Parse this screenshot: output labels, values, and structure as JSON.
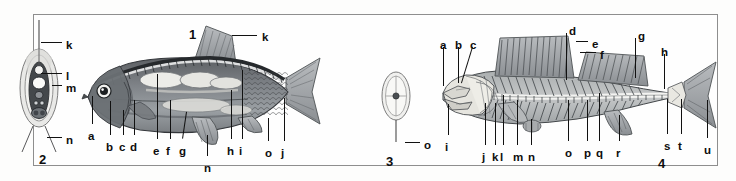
{
  "plate": {
    "title": "Fish anatomy plate",
    "background_color": "#fdfdfc",
    "frame_color": "#8e8e8e",
    "label_color": "#0d0d0d",
    "figure_numbers": [
      {
        "id": "fig1",
        "text": "1",
        "x": 189,
        "y": 28
      },
      {
        "id": "fig2",
        "text": "2",
        "x": 39,
        "y": 153
      },
      {
        "id": "fig3",
        "text": "3",
        "x": 386,
        "y": 155
      },
      {
        "id": "fig4",
        "text": "4",
        "x": 658,
        "y": 157
      }
    ]
  },
  "figure1": {
    "name": "whole-fish-lateral-view",
    "labels": [
      {
        "key": "a",
        "x": 88,
        "y": 131,
        "lead": {
          "x1": 92,
          "y1": 96,
          "x2": 92,
          "y2": 124
        }
      },
      {
        "key": "b",
        "x": 106,
        "y": 142,
        "lead": {
          "x1": 110,
          "y1": 101,
          "x2": 110,
          "y2": 135
        }
      },
      {
        "key": "c",
        "x": 119,
        "y": 142,
        "lead": {
          "x1": 123,
          "y1": 110,
          "x2": 123,
          "y2": 135
        }
      },
      {
        "key": "d",
        "x": 130,
        "y": 142,
        "lead": {
          "x1": 134,
          "y1": 100,
          "x2": 134,
          "y2": 135
        }
      },
      {
        "key": "e",
        "x": 153,
        "y": 146,
        "lead": {
          "x1": 157,
          "y1": 74,
          "x2": 157,
          "y2": 139
        }
      },
      {
        "key": "f",
        "x": 166,
        "y": 146,
        "lead": {
          "x1": 170,
          "y1": 100,
          "x2": 170,
          "y2": 139
        }
      },
      {
        "key": "g",
        "x": 179,
        "y": 146,
        "lead": {
          "x1": 187,
          "y1": 112,
          "x2": 183,
          "y2": 139
        }
      },
      {
        "key": "n",
        "x": 204,
        "y": 163,
        "lead": {
          "x1": 207,
          "y1": 135,
          "x2": 207,
          "y2": 156
        }
      },
      {
        "key": "h",
        "x": 227,
        "y": 146,
        "lead": {
          "x1": 231,
          "y1": 90,
          "x2": 231,
          "y2": 139
        }
      },
      {
        "key": "i",
        "x": 239,
        "y": 146,
        "lead": {
          "x1": 242,
          "y1": 70,
          "x2": 242,
          "y2": 139
        }
      },
      {
        "key": "o",
        "x": 265,
        "y": 148,
        "lead": {
          "x1": 268,
          "y1": 118,
          "x2": 268,
          "y2": 141
        }
      },
      {
        "key": "j",
        "x": 281,
        "y": 148,
        "lead": {
          "x1": 284,
          "y1": 98,
          "x2": 284,
          "y2": 141
        }
      },
      {
        "key": "k",
        "x": 262,
        "y": 32,
        "lead": {
          "x1": 232,
          "y1": 35,
          "x2": 257,
          "y2": 35
        }
      }
    ]
  },
  "figure2": {
    "name": "fish-cross-section-diagram",
    "labels": [
      {
        "key": "k",
        "x": 66,
        "y": 40,
        "lead": {
          "x1": 41,
          "y1": 42,
          "x2": 62,
          "y2": 42
        }
      },
      {
        "key": "l",
        "x": 66,
        "y": 71,
        "lead": {
          "x1": 41,
          "y1": 73,
          "x2": 62,
          "y2": 73
        }
      },
      {
        "key": "m",
        "x": 66,
        "y": 83,
        "lead": {
          "x1": 52,
          "y1": 85,
          "x2": 62,
          "y2": 85
        }
      },
      {
        "key": "n",
        "x": 66,
        "y": 135,
        "lead": {
          "x1": 47,
          "y1": 137,
          "x2": 62,
          "y2": 137
        }
      }
    ]
  },
  "figure3": {
    "name": "scale-or-vertebra-cross-section",
    "labels": [
      {
        "key": "o",
        "x": 424,
        "y": 140,
        "lead": {
          "x1": 405,
          "y1": 142,
          "x2": 420,
          "y2": 142
        }
      }
    ]
  },
  "figure4": {
    "name": "fish-skeleton-lateral-view",
    "labels": [
      {
        "key": "a",
        "x": 440,
        "y": 40,
        "lead": {
          "x1": 443,
          "y1": 47,
          "x2": 443,
          "y2": 86
        }
      },
      {
        "key": "b",
        "x": 455,
        "y": 40,
        "lead": {
          "x1": 458,
          "y1": 47,
          "x2": 458,
          "y2": 83
        }
      },
      {
        "key": "c",
        "x": 470,
        "y": 40,
        "lead": {
          "x1": 473,
          "y1": 47,
          "x2": 462,
          "y2": 83
        }
      },
      {
        "key": "d",
        "x": 569,
        "y": 26,
        "lead": {
          "x1": 566,
          "y1": 33,
          "x2": 566,
          "y2": 80
        }
      },
      {
        "key": "e",
        "x": 592,
        "y": 39,
        "lead": {
          "x1": 576,
          "y1": 41,
          "x2": 588,
          "y2": 41
        }
      },
      {
        "key": "f",
        "x": 600,
        "y": 50,
        "lead": {
          "x1": 580,
          "y1": 52,
          "x2": 596,
          "y2": 52
        }
      },
      {
        "key": "g",
        "x": 638,
        "y": 31,
        "lead": {
          "x1": 635,
          "y1": 38,
          "x2": 635,
          "y2": 78
        }
      },
      {
        "key": "h",
        "x": 661,
        "y": 47,
        "lead": {
          "x1": 664,
          "y1": 54,
          "x2": 664,
          "y2": 89
        }
      },
      {
        "key": "i",
        "x": 445,
        "y": 142,
        "lead": {
          "x1": 448,
          "y1": 104,
          "x2": 448,
          "y2": 135
        }
      },
      {
        "key": "j",
        "x": 482,
        "y": 152,
        "lead": {
          "x1": 485,
          "y1": 103,
          "x2": 485,
          "y2": 145
        }
      },
      {
        "key": "k",
        "x": 492,
        "y": 152,
        "lead": {
          "x1": 495,
          "y1": 103,
          "x2": 495,
          "y2": 145
        }
      },
      {
        "key": "l",
        "x": 500,
        "y": 152,
        "lead": {
          "x1": 503,
          "y1": 95,
          "x2": 503,
          "y2": 145
        }
      },
      {
        "key": "m",
        "x": 513,
        "y": 152,
        "lead": {
          "x1": 517,
          "y1": 100,
          "x2": 517,
          "y2": 145
        }
      },
      {
        "key": "n",
        "x": 528,
        "y": 152,
        "lead": {
          "x1": 531,
          "y1": 119,
          "x2": 531,
          "y2": 145
        }
      },
      {
        "key": "o",
        "x": 565,
        "y": 148,
        "lead": {
          "x1": 568,
          "y1": 100,
          "x2": 568,
          "y2": 141
        }
      },
      {
        "key": "p",
        "x": 584,
        "y": 148,
        "lead": {
          "x1": 587,
          "y1": 100,
          "x2": 587,
          "y2": 141
        }
      },
      {
        "key": "q",
        "x": 596,
        "y": 148,
        "lead": {
          "x1": 599,
          "y1": 93,
          "x2": 599,
          "y2": 141
        }
      },
      {
        "key": "r",
        "x": 616,
        "y": 148,
        "lead": {
          "x1": 619,
          "y1": 115,
          "x2": 619,
          "y2": 141
        }
      },
      {
        "key": "s",
        "x": 664,
        "y": 141,
        "lead": {
          "x1": 667,
          "y1": 99,
          "x2": 667,
          "y2": 134
        }
      },
      {
        "key": "t",
        "x": 678,
        "y": 141,
        "lead": {
          "x1": 681,
          "y1": 99,
          "x2": 681,
          "y2": 134
        }
      },
      {
        "key": "u",
        "x": 704,
        "y": 145,
        "lead": {
          "x1": 707,
          "y1": 100,
          "x2": 707,
          "y2": 138
        }
      }
    ]
  }
}
